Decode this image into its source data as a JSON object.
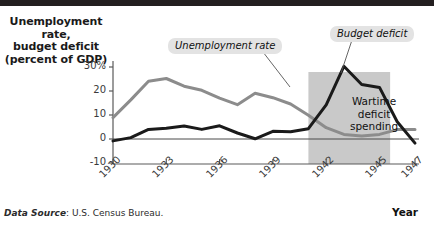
{
  "title_block": {
    "axis_title_line1": "Unemployment rate,",
    "axis_title_line2": "budget deficit",
    "axis_title_line3": "(percent of GDP)"
  },
  "xaxis_name": "Year",
  "source": {
    "label": "Data Source",
    "text": ": U.S. Census Bureau."
  },
  "callouts": {
    "unemployment": "Unemployment rate",
    "budget": "Budget deficit"
  },
  "inline_label": {
    "line1": "Wartime",
    "line2": "deficit",
    "line3": "spending"
  },
  "colors": {
    "unemployment_line": "#8c8c8c",
    "deficit_line": "#1a1a1a",
    "shaded_band": "#c9c9c9",
    "callout_bg": "#e3e3e3",
    "topbar": "#231f20",
    "axis": "#5a5a5a"
  },
  "chart_data": {
    "type": "line",
    "title": "",
    "xlabel": "Year",
    "ylabel": "Unemployment rate, budget deficit (percent of GDP)",
    "xlim": [
      1930,
      1947
    ],
    "ylim": [
      -10,
      32
    ],
    "yticks": [
      -10,
      0,
      10,
      20,
      30
    ],
    "ytick_labels": [
      "-10",
      "0",
      "10",
      "20",
      "30%"
    ],
    "xticks": [
      1930,
      1933,
      1936,
      1939,
      1942,
      1945,
      1947
    ],
    "xtick_labels": [
      "1930",
      "1933",
      "1936",
      "1939",
      "1942",
      "1945",
      "1947"
    ],
    "grid": false,
    "legend": "annotated callouts",
    "x": [
      1930,
      1931,
      1932,
      1933,
      1934,
      1935,
      1936,
      1937,
      1938,
      1939,
      1940,
      1941,
      1942,
      1943,
      1944,
      1945,
      1946,
      1947
    ],
    "series": [
      {
        "name": "Unemployment rate",
        "color": "#8c8c8c",
        "values": [
          8.9,
          16.3,
          24.1,
          25.2,
          22.0,
          20.3,
          17.0,
          14.3,
          19.1,
          17.2,
          14.6,
          9.9,
          4.7,
          1.9,
          1.2,
          1.9,
          3.9,
          3.9
        ]
      },
      {
        "name": "Budget deficit",
        "color": "#1a1a1a",
        "values": [
          -0.8,
          0.6,
          4.0,
          4.5,
          5.4,
          4.0,
          5.5,
          2.5,
          0.1,
          3.2,
          3.0,
          4.3,
          14.2,
          30.3,
          22.7,
          21.5,
          7.2,
          -1.7
        ]
      }
    ],
    "annotations": [
      {
        "text": "Unemployment rate",
        "type": "callout",
        "points_to_year": 1936
      },
      {
        "text": "Budget deficit",
        "type": "callout",
        "points_to_year": 1943
      },
      {
        "text": "Wartime deficit spending",
        "type": "inline",
        "span_years": [
          1941,
          1945.5
        ]
      }
    ],
    "shaded_region": {
      "x_start": 1941,
      "x_end": 1945.6,
      "y_top": 32,
      "y_bottom": -10,
      "color": "#c9c9c9"
    }
  }
}
